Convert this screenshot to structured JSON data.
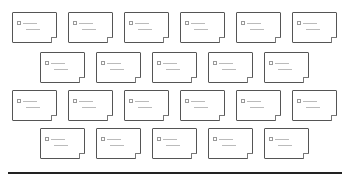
{
  "caption": "",
  "rows": [
    {
      "top": 12,
      "lefts": [
        12,
        68,
        124,
        180,
        236,
        292
      ]
    },
    {
      "top": 52,
      "lefts": [
        40,
        96,
        152,
        208,
        264
      ]
    },
    {
      "top": 90,
      "lefts": [
        12,
        68,
        124,
        180,
        236,
        292
      ]
    },
    {
      "top": 128,
      "lefts": [
        40,
        96,
        152,
        208,
        264
      ]
    }
  ],
  "card_count": 22,
  "colors": {
    "border": "#555555",
    "baseline": "#222222"
  }
}
